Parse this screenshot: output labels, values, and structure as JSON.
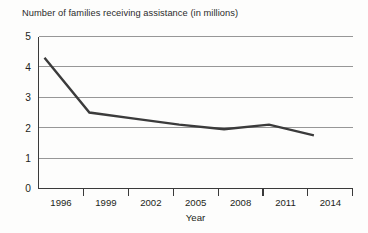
{
  "chart_data": {
    "type": "line",
    "title": "Number of families receiving assistance (in millions)",
    "xlabel": "Year",
    "ylabel": "",
    "categories": [
      "1996",
      "1999",
      "2002",
      "2005",
      "2008",
      "2011",
      "2014"
    ],
    "values": [
      4.3,
      2.5,
      2.3,
      2.1,
      1.95,
      2.1,
      1.75
    ],
    "series": [
      {
        "name": "Families receiving assistance",
        "values": [
          4.3,
          2.5,
          2.3,
          2.1,
          1.95,
          2.1,
          1.75
        ]
      }
    ],
    "ylim": [
      0,
      5
    ],
    "yticks": [
      "0",
      "1",
      "2",
      "3",
      "4",
      "5"
    ],
    "ytick_values": [
      0,
      1,
      2,
      3,
      4,
      5
    ],
    "grid": "horizontal",
    "legend": "none",
    "line_color": "#3b3b3b",
    "grid_color": "#8c8c8c",
    "axis_color": "#3a3a3a",
    "background_color": "#fdfdfc"
  },
  "labels": {
    "y0": "0",
    "y1": "1",
    "y2": "2",
    "y3": "3",
    "y4": "4",
    "y5": "5",
    "x0": "1996",
    "x1": "1999",
    "x2": "2002",
    "x3": "2005",
    "x4": "2008",
    "x5": "2011",
    "x6": "2014",
    "axis_x_title": "Year"
  }
}
